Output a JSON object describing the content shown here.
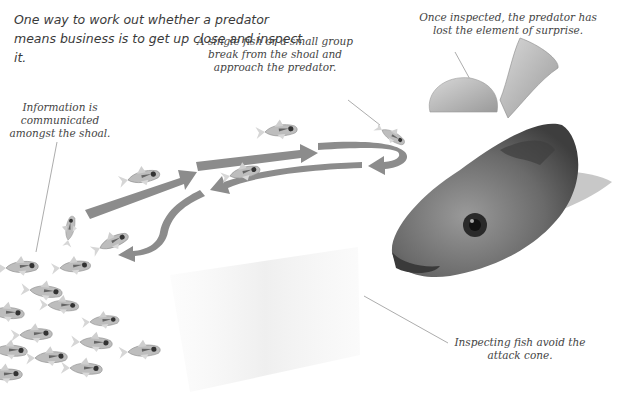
{
  "intro_text": "One way to work out whether a predator means business is to get up close and inspect it.",
  "annotations": {
    "surprise": "Once inspected, the predator has lost the element of surprise.",
    "break_away": "A single fish or a small group break from the shoal and approach the predator.",
    "information": "Information is communicated amongst the shoal.",
    "attack_cone": "Inspecting fish avoid the attack cone."
  },
  "figures": {
    "predator": "predator-fish",
    "shoal": "tetra-shoal",
    "arrows": "inspection-path-arrows",
    "cone": "attack-cone"
  },
  "colors": {
    "arrow": "#8c8c8c",
    "text": "#444444",
    "leader_line": "#888888",
    "predator_body": "#6e6e6e",
    "cone": "#f1f1f1"
  }
}
